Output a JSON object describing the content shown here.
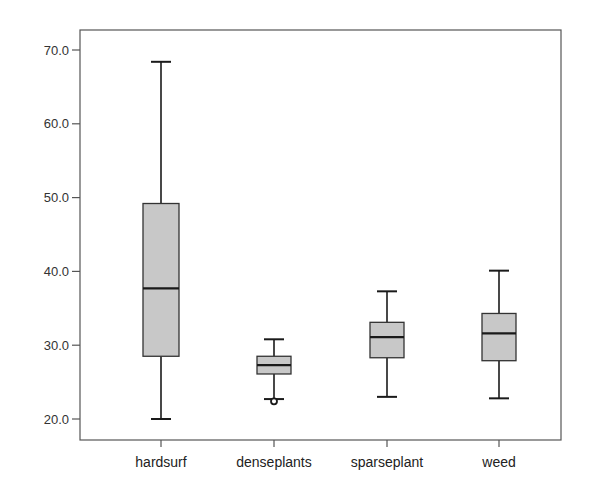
{
  "chart_data": {
    "type": "boxplot",
    "title": "",
    "xlabel": "",
    "ylabel": "",
    "ylim": [
      17.5,
      72.5
    ],
    "yticks": [
      20.0,
      30.0,
      40.0,
      50.0,
      60.0,
      70.0
    ],
    "ytick_labels": [
      "20.0",
      "30.0",
      "40.0",
      "50.0",
      "60.0",
      "70.0"
    ],
    "grid": false,
    "legend": null,
    "categories": [
      "hardsurf",
      "denseplants",
      "sparseplant",
      "weed"
    ],
    "boxes": [
      {
        "name": "hardsurf",
        "whisker_low": 20.0,
        "q1": 28.5,
        "median": 37.7,
        "q3": 49.2,
        "whisker_high": 68.4,
        "outliers": []
      },
      {
        "name": "denseplants",
        "whisker_low": 22.7,
        "q1": 26.1,
        "median": 27.3,
        "q3": 28.5,
        "whisker_high": 30.8,
        "outliers": [
          22.4
        ]
      },
      {
        "name": "sparseplant",
        "whisker_low": 23.0,
        "q1": 28.3,
        "median": 31.1,
        "q3": 33.1,
        "whisker_high": 37.3,
        "outliers": []
      },
      {
        "name": "weed",
        "whisker_low": 22.8,
        "q1": 27.9,
        "median": 31.6,
        "q3": 34.3,
        "whisker_high": 40.1,
        "outliers": []
      }
    ],
    "colors": {
      "box_fill": "#c8c8c8",
      "line": "#1a1a1a",
      "frame": "#555555"
    }
  }
}
